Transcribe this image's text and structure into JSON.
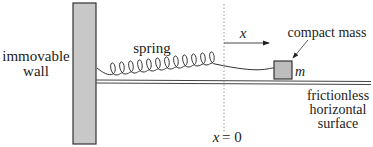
{
  "diagram": {
    "labels": {
      "wall_line1": "immovable",
      "wall_line2": "wall",
      "spring": "spring",
      "mass": "compact mass",
      "mass_symbol": "m",
      "displacement": "x",
      "origin_x": "x",
      "origin_eq": "= 0",
      "surface_line1": "frictionless",
      "surface_line2": "horizontal",
      "surface_line3": "surface"
    },
    "colors": {
      "wall_fill": "#c8c8c8",
      "mass_fill": "#bdbdbd",
      "stroke": "#333333",
      "surface": "#444444",
      "dotted_line": "#999999"
    }
  }
}
